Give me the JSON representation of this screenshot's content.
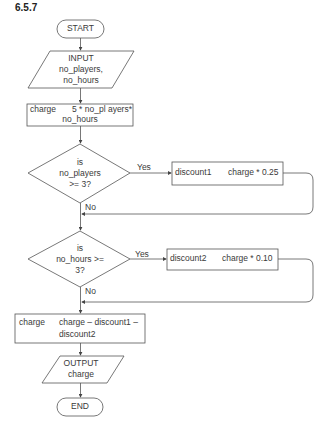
{
  "title": "6.5.7",
  "flowchart": {
    "start": "START",
    "input": {
      "line1": "INPUT",
      "line2": "no_players,",
      "line3": "no_hours"
    },
    "calc_charge": {
      "var": "charge",
      "expr1": "5 * no_pl ayers*",
      "expr2": "no_hours"
    },
    "decision1": {
      "line1": "is",
      "line2": "no_players",
      "line3": ">= 3?",
      "yes": "Yes",
      "no": "No"
    },
    "discount1": {
      "var": "discount1",
      "expr": "charge * 0.25"
    },
    "decision2": {
      "line1": "is",
      "line2": "no_hours >=",
      "line3": "3?",
      "yes": "Yes",
      "no": "No"
    },
    "discount2": {
      "var": "discount2",
      "expr": "charge * 0.10"
    },
    "final_charge": {
      "var": "charge",
      "expr1": "charge – discount1 –",
      "expr2": "discount2"
    },
    "output": {
      "line1": "OUTPUT",
      "line2": "charge"
    },
    "end": "END"
  },
  "colors": {
    "stroke": "#555555",
    "text": "#3a3a3a"
  }
}
